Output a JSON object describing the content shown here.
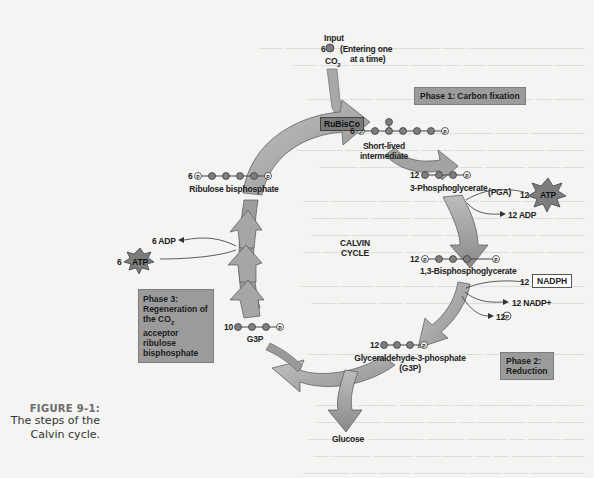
{
  "figure": {
    "number_label": "FIGURE 9-1:",
    "caption_line1": "The steps of the",
    "caption_line2": "Calvin cycle."
  },
  "center": {
    "line1": "CALVIN",
    "line2": "CYCLE"
  },
  "input": {
    "title": "Input",
    "count": "6",
    "molecule": "CO",
    "molecule_sub": "2",
    "note_line1": "(Entering one",
    "note_line2": "at a time)"
  },
  "enzyme": {
    "label": "RuBisCo"
  },
  "phases": [
    {
      "id": "phase1",
      "line1": "Phase 1: Carbon fixation",
      "line2": ""
    },
    {
      "id": "phase2",
      "line1": "Phase 2:",
      "line2": "Reduction"
    },
    {
      "id": "phase3",
      "line1": "Phase 3:",
      "line2": "Regeneration of",
      "line3": "the CO",
      "line3_sub": "2",
      "line3_rest": " acceptor",
      "line4": "ribulose bisphosphate"
    }
  ],
  "molecules": [
    {
      "id": "short_lived",
      "count": "6",
      "name_line1": "Short-lived",
      "name_line2": "intermediate"
    },
    {
      "id": "pga",
      "count": "12",
      "name": "3-Phosphoglycerate",
      "alias": "(PGA)"
    },
    {
      "id": "bpg",
      "count": "12",
      "name": "1,3-Bisphosphoglycerate"
    },
    {
      "id": "g3p_12",
      "count": "12",
      "name": "Glyceraldehyde-3-phosphate",
      "alias": "(G3P)"
    },
    {
      "id": "g3p_10",
      "count": "10",
      "name": "G3P"
    },
    {
      "id": "rubp",
      "count": "6",
      "name": "Ribulose bisphosphate"
    },
    {
      "id": "glucose",
      "name": "Glucose"
    }
  ],
  "energy": {
    "atp_in_count": "12",
    "atp_label": "ATP",
    "adp_out": "12 ADP",
    "nadph_count": "12",
    "nadph_label": "NADPH",
    "nadp_out": "12 NADP+",
    "pi_out_count": "12",
    "pi_symbol": "P",
    "regen_atp_count": "6",
    "regen_adp_out": "6 ADP"
  },
  "colors": {
    "arrow_fill": "#a9a9a9",
    "arrow_dark": "#8c8c8c",
    "phase_box": "#9b9b9b",
    "carbon_ball": "#7e7e7e",
    "background": "#f4f4f2"
  }
}
